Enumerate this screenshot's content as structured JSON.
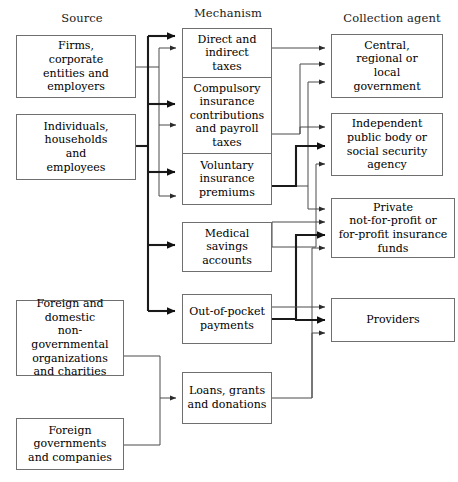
{
  "diagram": {
    "columns": [
      {
        "id": "source",
        "label": "Source"
      },
      {
        "id": "mechanism",
        "label": "Mechanism"
      },
      {
        "id": "collection_agent",
        "label": "Collection agent"
      }
    ],
    "colors": {
      "box_border": "#6f6f6f",
      "thin_line": "#4a4a4a",
      "bold_line": "#1a1a1a",
      "background": "#ffffff",
      "text": "#000000"
    },
    "source_nodes": [
      {
        "id": "firms",
        "lines": [
          "Firms,",
          "corporate",
          "entities and",
          "employers"
        ]
      },
      {
        "id": "individuals",
        "lines": [
          "Individuals,",
          "households",
          "and",
          "employees"
        ]
      },
      {
        "id": "ngos",
        "lines": [
          "Foreign and",
          "domestic",
          "non-governmental",
          "organizations",
          "and charities"
        ]
      },
      {
        "id": "foreign_gov",
        "lines": [
          "Foreign",
          "governments",
          "and companies"
        ]
      }
    ],
    "mechanism_nodes": [
      {
        "id": "taxes",
        "lines": [
          "Direct and",
          "indirect",
          "taxes"
        ]
      },
      {
        "id": "compulsory",
        "lines": [
          "Compulsory",
          "insurance",
          "contributions",
          "and payroll",
          "taxes"
        ]
      },
      {
        "id": "voluntary",
        "lines": [
          "Voluntary",
          "insurance",
          "premiums"
        ]
      },
      {
        "id": "msa",
        "lines": [
          "Medical",
          "savings",
          "accounts"
        ]
      },
      {
        "id": "oop",
        "lines": [
          "Out-of-pocket",
          "payments"
        ]
      },
      {
        "id": "loans",
        "lines": [
          "Loans, grants",
          "and donations"
        ]
      }
    ],
    "agent_nodes": [
      {
        "id": "government",
        "lines": [
          "Central,",
          "regional or",
          "local",
          "government"
        ]
      },
      {
        "id": "independent",
        "lines": [
          "Independent",
          "public body or",
          "social security",
          "agency"
        ]
      },
      {
        "id": "private",
        "lines": [
          "Private",
          "not-for-profit or",
          "for-profit insurance",
          "funds"
        ]
      },
      {
        "id": "providers",
        "lines": [
          "Providers"
        ]
      }
    ],
    "flows": [
      {
        "from": "individuals",
        "to": "taxes",
        "weight": "bold"
      },
      {
        "from": "firms",
        "to": "taxes",
        "weight": "thin"
      },
      {
        "from": "individuals",
        "to": "compulsory",
        "weight": "bold"
      },
      {
        "from": "firms",
        "to": "compulsory",
        "weight": "thin"
      },
      {
        "from": "individuals",
        "to": "voluntary",
        "weight": "bold"
      },
      {
        "from": "firms",
        "to": "voluntary",
        "weight": "thin"
      },
      {
        "from": "individuals",
        "to": "msa",
        "weight": "bold"
      },
      {
        "from": "individuals",
        "to": "oop",
        "weight": "bold"
      },
      {
        "from": "ngos",
        "to": "loans",
        "weight": "thin"
      },
      {
        "from": "foreign_gov",
        "to": "loans",
        "weight": "thin"
      },
      {
        "from": "taxes",
        "to": "government",
        "weight": "thin"
      },
      {
        "from": "compulsory",
        "to": "government",
        "weight": "thin"
      },
      {
        "from": "voluntary",
        "to": "government",
        "weight": "thin"
      },
      {
        "from": "compulsory",
        "to": "independent",
        "weight": "thin"
      },
      {
        "from": "voluntary",
        "to": "independent",
        "weight": "bold"
      },
      {
        "from": "msa",
        "to": "independent",
        "weight": "thin"
      },
      {
        "from": "voluntary",
        "to": "private",
        "weight": "thin"
      },
      {
        "from": "msa",
        "to": "private",
        "weight": "thin"
      },
      {
        "from": "oop",
        "to": "private",
        "weight": "bold"
      },
      {
        "from": "loans",
        "to": "private",
        "weight": "thin"
      },
      {
        "from": "msa",
        "to": "providers",
        "weight": "thin"
      },
      {
        "from": "oop",
        "to": "providers",
        "weight": "bold"
      },
      {
        "from": "loans",
        "to": "providers",
        "weight": "thin"
      }
    ]
  }
}
